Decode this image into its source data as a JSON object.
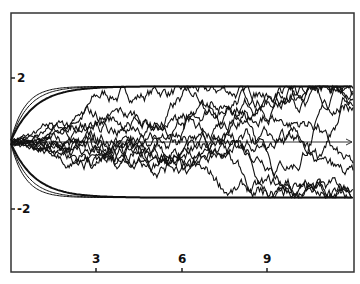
{
  "chart_data": {
    "type": "line",
    "title": "",
    "xlabel": "",
    "ylabel": "",
    "xlim": [
      0,
      12
    ],
    "ylim": [
      -4.5,
      4.5
    ],
    "x_ticks": [
      3,
      6,
      9
    ],
    "x_tick_labels": [
      "3",
      "6",
      "9"
    ],
    "y_ticks": [
      2,
      -2
    ],
    "y_tick_labels": [
      "2",
      "-2"
    ],
    "grid": false,
    "legend": null,
    "annotations": [
      "horizontal arrow along y = 0 pointing right"
    ],
    "upper_bound": 1.7,
    "lower_bound": -1.7,
    "series_count": 12
  },
  "axes": {
    "y_tick_top": "2",
    "y_tick_bottom": "-2",
    "x_tick_1": "3",
    "x_tick_2": "6",
    "x_tick_3": "9"
  },
  "colors": {
    "line": "#111111",
    "background": "#ffffff",
    "frame": "#333333"
  }
}
